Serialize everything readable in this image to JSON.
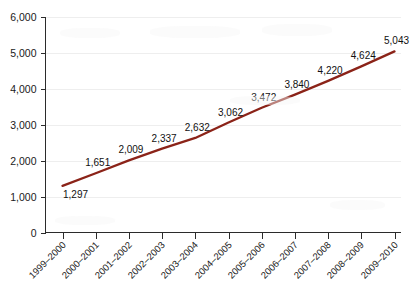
{
  "chart_data": {
    "type": "line",
    "title": "",
    "subtitle": "",
    "xlabel": "",
    "ylabel": "",
    "categories": [
      "1999–2000",
      "2000–2001",
      "2001–2002",
      "2002–2003",
      "2003–2004",
      "2004–2005",
      "2005–2006",
      "2006–2007",
      "2007–2008",
      "2008–2009",
      "2009–2010"
    ],
    "values": [
      1297,
      1651,
      2009,
      2337,
      2632,
      3062,
      3472,
      3840,
      4220,
      4624,
      5043
    ],
    "data_labels": [
      "1,297",
      "1,651",
      "2,009",
      "2,337",
      "2,632",
      "3,062",
      "3,472",
      "3,840",
      "4,220",
      "4,624",
      "5,043"
    ],
    "ylim": [
      0,
      6000
    ],
    "yticks": [
      0,
      1000,
      2000,
      3000,
      4000,
      5000,
      6000
    ],
    "ytick_labels": [
      "0",
      "1,000",
      "2,000",
      "3,000",
      "4,000",
      "5,000",
      "6,000"
    ],
    "grid": true,
    "legend": false,
    "legend_position": "none",
    "series": [
      {
        "name": "series-1",
        "color": "#8B2318",
        "values": [
          1297,
          1651,
          2009,
          2337,
          2632,
          3062,
          3472,
          3840,
          4220,
          4624,
          5043
        ]
      }
    ],
    "colors": {
      "line": "#8B2318",
      "axis": "#2b2b2b",
      "grid": "#eeeeee",
      "text": "#111111",
      "background": "#ffffff"
    },
    "xtick_label_rotation": -45
  }
}
